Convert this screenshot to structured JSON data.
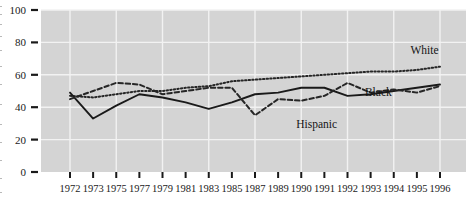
{
  "chart_data": {
    "type": "line",
    "title": "",
    "subtitle": "",
    "xlabel": "",
    "ylabel": "",
    "grid": true,
    "legend_position": "inline-labels",
    "xlim": [
      1972,
      1996
    ],
    "ylim": [
      0,
      100
    ],
    "yticks": [
      0,
      20,
      40,
      60,
      80,
      100
    ],
    "x": [
      1972,
      1973,
      1975,
      1977,
      1979,
      1981,
      1983,
      1985,
      1987,
      1989,
      1990,
      1991,
      1992,
      1993,
      1994,
      1995,
      1996
    ],
    "categories": [
      "1972",
      "1973",
      "1975",
      "1977",
      "1979",
      "1981",
      "1983",
      "1985",
      "1987",
      "1989",
      "1990",
      "1991",
      "1992",
      "1993",
      "1994",
      "1995",
      "1996"
    ],
    "series": [
      {
        "name": "White",
        "style": "dotted",
        "color": "#262626",
        "label_x": 1995,
        "label_y": 73,
        "values": [
          47,
          46,
          48,
          50,
          50,
          52,
          53,
          56,
          57,
          58,
          59,
          60,
          61,
          62,
          62,
          63,
          65
        ]
      },
      {
        "name": "Black",
        "style": "solid",
        "color": "#1a1a1a",
        "label_x": 1992,
        "label_y": 47,
        "values": [
          49,
          33,
          41,
          48,
          46,
          43,
          39,
          43,
          48,
          49,
          52,
          52,
          47,
          48,
          50,
          52,
          54
        ]
      },
      {
        "name": "Hispanic",
        "style": "dashed",
        "color": "#262626",
        "label_x": 1988,
        "label_y": 27,
        "values": [
          45,
          50,
          55,
          54,
          48,
          50,
          52,
          52,
          35,
          45,
          44,
          47,
          55,
          49,
          51,
          49,
          53
        ]
      }
    ]
  },
  "axes": {
    "y_labels": [
      "100",
      "80",
      "60",
      "40",
      "20",
      "0"
    ],
    "x_labels": [
      "1972",
      "1973",
      "1975",
      "1977",
      "1979",
      "1981",
      "1983",
      "1985",
      "1987",
      "1989",
      "1990",
      "1991",
      "1992",
      "1993",
      "1994",
      "1995",
      "1996"
    ]
  },
  "labels": {
    "white": "White",
    "black": "Black",
    "hispanic": "Hispanic"
  },
  "colors": {
    "plot_background": "#d4d4d4",
    "gridline": "#f2f2f2",
    "page_background": "#ffffff",
    "ink": "#1a1a1a"
  }
}
